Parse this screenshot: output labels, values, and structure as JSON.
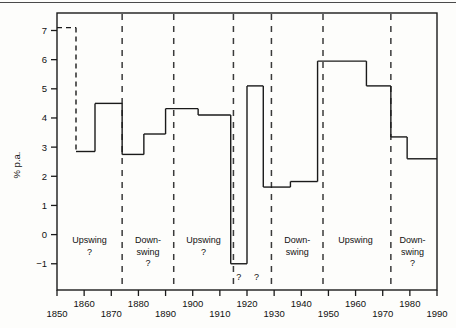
{
  "chart_data": {
    "type": "line",
    "subtype": "step",
    "title": "",
    "xlabel": "",
    "ylabel": "% p.a.",
    "xlim": [
      1850,
      1990
    ],
    "ylim": [
      -1.9,
      7.6
    ],
    "yticks": [
      -1,
      0,
      1,
      2,
      3,
      4,
      5,
      6,
      7
    ],
    "ytick_labels": [
      "−1",
      "0",
      "1",
      "2",
      "3",
      "4",
      "5",
      "6",
      "7"
    ],
    "xticks": [
      1850,
      1860,
      1870,
      1880,
      1890,
      1900,
      1910,
      1920,
      1930,
      1940,
      1950,
      1960,
      1970,
      1980,
      1990
    ],
    "xtick_labels": [
      "1850",
      "1860",
      "1870",
      "1880",
      "1890",
      "1900",
      "1910",
      "1920",
      "1930",
      "1940",
      "1950",
      "1960",
      "1970",
      "1980",
      "1990"
    ],
    "grid": false,
    "legend": null,
    "steps": [
      {
        "x0": 1850,
        "x1": 1857,
        "value": 7.1,
        "style": "dashed"
      },
      {
        "x0": 1857,
        "x1": 1864,
        "value": 2.85,
        "style": "solid"
      },
      {
        "x0": 1864,
        "x1": 1874,
        "value": 4.5,
        "style": "solid"
      },
      {
        "x0": 1874,
        "x1": 1882,
        "value": 2.75,
        "style": "solid"
      },
      {
        "x0": 1882,
        "x1": 1890,
        "value": 3.45,
        "style": "solid"
      },
      {
        "x0": 1890,
        "x1": 1902,
        "value": 4.32,
        "style": "solid"
      },
      {
        "x0": 1902,
        "x1": 1914,
        "value": 4.1,
        "style": "solid"
      },
      {
        "x0": 1914,
        "x1": 1920,
        "value": -1.0,
        "style": "solid"
      },
      {
        "x0": 1920,
        "x1": 1926,
        "value": 5.1,
        "style": "solid"
      },
      {
        "x0": 1926,
        "x1": 1936,
        "value": 1.63,
        "style": "solid"
      },
      {
        "x0": 1936,
        "x1": 1946,
        "value": 1.82,
        "style": "solid"
      },
      {
        "x0": 1946,
        "x1": 1964,
        "value": 5.95,
        "style": "solid"
      },
      {
        "x0": 1964,
        "x1": 1973,
        "value": 5.1,
        "style": "solid"
      },
      {
        "x0": 1973,
        "x1": 1979,
        "value": 3.35,
        "style": "solid"
      },
      {
        "x0": 1979,
        "x1": 1990,
        "value": 2.6,
        "style": "solid"
      }
    ],
    "phase_dividers": [
      1874,
      1893,
      1915,
      1929,
      1948,
      1973
    ],
    "phase_annotations": [
      {
        "x": 1862,
        "lines": [
          "Upswing",
          "?"
        ]
      },
      {
        "x": 1883.5,
        "lines": [
          "Down-",
          "swing",
          "?"
        ]
      },
      {
        "x": 1904,
        "lines": [
          "Upswing",
          "?"
        ]
      },
      {
        "x": 1938.5,
        "lines": [
          "Down-",
          "swing"
        ]
      },
      {
        "x": 1960,
        "lines": [
          "Upswing"
        ]
      },
      {
        "x": 1981,
        "lines": [
          "Down-",
          "swing",
          "?"
        ]
      }
    ],
    "point_annotations": [
      {
        "x": 1917,
        "y": -1.55,
        "text": "?"
      },
      {
        "x": 1923.5,
        "y": -1.55,
        "text": "?"
      }
    ],
    "colors": {
      "line": "#1a1a1a",
      "axis": "#1a1a1a",
      "divider": "#3a3a3a",
      "background": "#fdfdfb"
    }
  }
}
